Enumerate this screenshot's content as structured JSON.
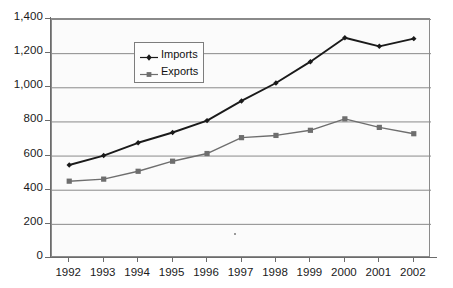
{
  "chart_data": {
    "type": "line",
    "title": "",
    "xlabel": "",
    "ylabel": "",
    "categories": [
      "1992",
      "1993",
      "1994",
      "1995",
      "1996",
      "1997",
      "1998",
      "1999",
      "2000",
      "2001",
      "2002"
    ],
    "series": [
      {
        "name": "Imports",
        "marker": "diamond",
        "color": "#1a1a1a",
        "values": [
          545,
          600,
          675,
          735,
          805,
          920,
          1025,
          1150,
          1290,
          1240,
          1285
        ]
      },
      {
        "name": "Exports",
        "marker": "square",
        "color": "#6e6e6e",
        "values": [
          450,
          462,
          508,
          567,
          612,
          705,
          718,
          748,
          815,
          765,
          728
        ]
      }
    ],
    "ylim": [
      0,
      1400
    ],
    "ytick_labels": [
      "0",
      "200",
      "400",
      "600",
      "800",
      "1,000",
      "1,200",
      "1,400"
    ],
    "ytick_values": [
      0,
      200,
      400,
      600,
      800,
      1000,
      1200,
      1400
    ],
    "grid": true,
    "grid_axis": "y",
    "legend_position": "upper-left-inside"
  },
  "legend": {
    "items": [
      {
        "label": "Imports"
      },
      {
        "label": "Exports"
      }
    ]
  },
  "colors": {
    "imports_line": "#1a1a1a",
    "exports_line": "#6e6e6e",
    "gridline": "#8a8a8a",
    "axis": "#6b6b6b",
    "plot_background": "#fbfbfb",
    "page_background": "#ffffff",
    "text": "#1a1a1a"
  }
}
